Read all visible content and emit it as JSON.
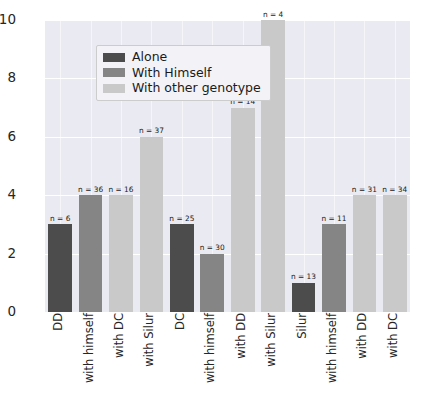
{
  "chart_data": {
    "type": "bar",
    "title": "",
    "subtitle": "",
    "xlabel": "",
    "ylabel": "",
    "ylim": [
      0,
      10
    ],
    "yticks": [
      "0",
      "2",
      "4",
      "6",
      "8",
      "10"
    ],
    "grid": true,
    "legend_position": "upper left",
    "legend": [
      {
        "label": "Alone",
        "color": "#4c4c4c"
      },
      {
        "label": "With Himself",
        "color": "#858585"
      },
      {
        "label": "With other genotype",
        "color": "#c9c9c9"
      }
    ],
    "categories": [
      "DD",
      "with himself",
      "with DC",
      "with Silur",
      "DC",
      "with himself",
      "with DD",
      "with Silur",
      "Silur",
      "with himself",
      "with DD",
      "with DC"
    ],
    "values": [
      3,
      4,
      4,
      6,
      3,
      2,
      7,
      10,
      1,
      3,
      4,
      4
    ],
    "annotations": [
      "n = 6",
      "n = 36",
      "n = 16",
      "n = 37",
      "n = 25",
      "n = 30",
      "n = 14",
      "n = 4",
      "n = 13",
      "n = 11",
      "n = 31",
      "n = 34"
    ],
    "series_of_bar": [
      "Alone",
      "With Himself",
      "With other genotype",
      "With other genotype",
      "Alone",
      "With Himself",
      "With other genotype",
      "With other genotype",
      "Alone",
      "With Himself",
      "With other genotype",
      "With other genotype"
    ],
    "bar_color_keys": [
      "alone",
      "himself",
      "other",
      "other",
      "alone",
      "himself",
      "other",
      "other",
      "alone",
      "himself",
      "other",
      "other"
    ],
    "colors": {
      "alone": "#4c4c4c",
      "himself": "#858585",
      "other": "#c9c9c9",
      "plot_background": "#eaeaf2",
      "gridline": "#ffffff",
      "figure_background": "#ffffff",
      "text": "#262626"
    }
  }
}
